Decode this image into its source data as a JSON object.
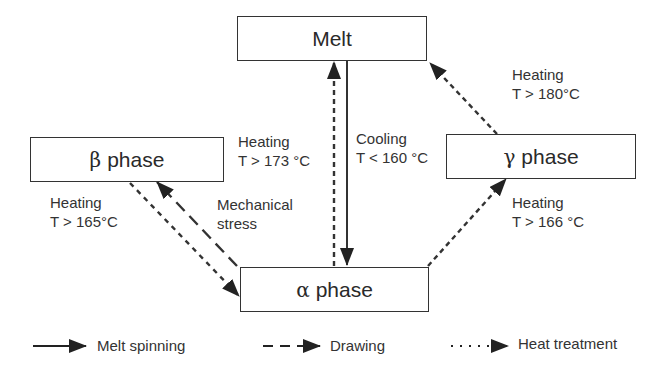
{
  "diagram": {
    "nodes": {
      "melt": {
        "label": "Melt"
      },
      "beta": {
        "greek": "β",
        "label": "phase"
      },
      "gamma": {
        "greek": "γ",
        "label": "phase"
      },
      "alpha": {
        "greek": "α",
        "label": "phase"
      }
    },
    "edges": [
      {
        "from": "alpha",
        "to": "melt",
        "style": "heat-treatment",
        "label1": "Heating",
        "label2": "T > 173 °C"
      },
      {
        "from": "melt",
        "to": "alpha",
        "style": "melt-spinning",
        "label1": "Cooling",
        "label2": "T < 160 °C"
      },
      {
        "from": "gamma",
        "to": "melt",
        "style": "heat-treatment",
        "label1": "Heating",
        "label2": "T > 180°C"
      },
      {
        "from": "beta",
        "to": "alpha",
        "style": "heat-treatment",
        "label1": "Heating",
        "label2": "T > 165°C"
      },
      {
        "from": "alpha",
        "to": "beta",
        "style": "drawing",
        "label1": "Mechanical",
        "label2": "stress"
      },
      {
        "from": "alpha",
        "to": "gamma",
        "style": "heat-treatment",
        "label1": "Heating",
        "label2": "T > 166 °C"
      }
    ],
    "legend": [
      {
        "style": "solid",
        "label": "Melt spinning"
      },
      {
        "style": "dashed",
        "label": "Drawing"
      },
      {
        "style": "dotted",
        "label": "Heat treatment"
      }
    ],
    "colors": {
      "line": "#333333",
      "background": "#ffffff"
    }
  }
}
